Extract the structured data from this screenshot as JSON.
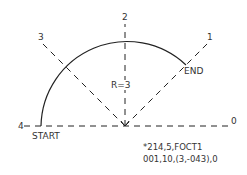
{
  "diagram": {
    "type": "octant-arc-definition",
    "direction_labels": [
      "0",
      "1",
      "2",
      "3",
      "4"
    ],
    "radius_label": "R=3",
    "start_label": "START",
    "end_label": "END",
    "code_lines": [
      "*214,5,FOCT1",
      "001,10,(3,-043),0"
    ],
    "colors": {
      "line": "#222222",
      "text": "#333333",
      "background": "#ffffff"
    }
  }
}
